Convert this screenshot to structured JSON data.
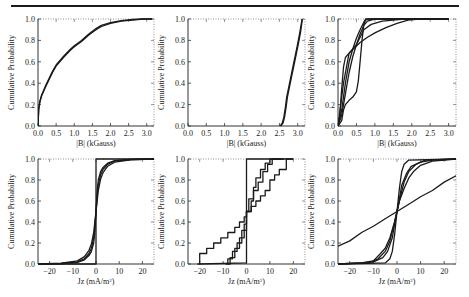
{
  "figure": {
    "top_rule": true,
    "line_color": "#1a1a1a"
  },
  "chart_data": [
    {
      "id": "panel-top-left",
      "type": "line",
      "title": "",
      "xlabel": "|B| (kGauss)",
      "ylabel": "Cumulative Probability",
      "xlim": [
        0.0,
        3.2
      ],
      "ylim": [
        0.0,
        1.0
      ],
      "xticks": [
        "0.0",
        "0.5",
        "1.0",
        "1.5",
        "2.0",
        "2.5",
        "3.0"
      ],
      "xtick_values": [
        0.0,
        0.5,
        1.0,
        1.5,
        2.0,
        2.5,
        3.0
      ],
      "yticks": [
        "0.0",
        "0.2",
        "0.4",
        "0.6",
        "0.8",
        "1.0"
      ],
      "ytick_values": [
        0.0,
        0.2,
        0.4,
        0.6,
        0.8,
        1.0
      ],
      "grid": false,
      "series": [
        {
          "name": "cdf-1",
          "x": [
            0.0,
            0.02,
            0.05,
            0.1,
            0.2,
            0.3,
            0.4,
            0.5,
            0.7,
            0.9,
            1.0,
            1.2,
            1.4,
            1.6,
            1.75,
            2.0,
            2.3,
            2.6,
            2.9,
            3.15
          ],
          "y": [
            0.0,
            0.15,
            0.22,
            0.28,
            0.36,
            0.43,
            0.5,
            0.56,
            0.64,
            0.71,
            0.74,
            0.79,
            0.85,
            0.9,
            0.93,
            0.96,
            0.98,
            0.99,
            1.0,
            1.0
          ]
        },
        {
          "name": "cdf-2",
          "x": [
            0.0,
            0.02,
            0.05,
            0.1,
            0.2,
            0.3,
            0.4,
            0.5,
            0.7,
            0.9,
            1.0,
            1.2,
            1.4,
            1.6,
            1.75,
            2.0,
            2.3,
            2.6,
            2.9,
            3.15
          ],
          "y": [
            0.0,
            0.16,
            0.23,
            0.29,
            0.37,
            0.44,
            0.51,
            0.57,
            0.65,
            0.72,
            0.75,
            0.8,
            0.86,
            0.91,
            0.94,
            0.965,
            0.985,
            0.995,
            1.0,
            1.0
          ]
        }
      ]
    },
    {
      "id": "panel-top-middle",
      "type": "line",
      "title": "",
      "xlabel": "|B| (kGauss)",
      "ylabel": "Cumulative Probability",
      "xlim": [
        0.0,
        3.2
      ],
      "ylim": [
        0.0,
        1.0
      ],
      "xticks": [
        "0.0",
        "0.5",
        "1.0",
        "1.5",
        "2.0",
        "2.5",
        "3.0"
      ],
      "xtick_values": [
        0.0,
        0.5,
        1.0,
        1.5,
        2.0,
        2.5,
        3.0
      ],
      "yticks": [
        "0.0",
        "0.2",
        "0.4",
        "0.6",
        "0.8",
        "1.0"
      ],
      "ytick_values": [
        0.0,
        0.2,
        0.4,
        0.6,
        0.8,
        1.0
      ],
      "grid": false,
      "series": [
        {
          "name": "cdf-1",
          "x": [
            2.52,
            2.58,
            2.62,
            2.66,
            2.7,
            2.76,
            2.82,
            2.88,
            2.94,
            3.0,
            3.06,
            3.12
          ],
          "y": [
            0.0,
            0.03,
            0.08,
            0.17,
            0.27,
            0.37,
            0.47,
            0.57,
            0.67,
            0.77,
            0.88,
            1.0
          ]
        },
        {
          "name": "cdf-2",
          "x": [
            2.54,
            2.6,
            2.64,
            2.68,
            2.72,
            2.78,
            2.84,
            2.9,
            2.96,
            3.02,
            3.08,
            3.13
          ],
          "y": [
            0.0,
            0.03,
            0.08,
            0.17,
            0.27,
            0.37,
            0.47,
            0.57,
            0.67,
            0.77,
            0.88,
            1.0
          ]
        }
      ]
    },
    {
      "id": "panel-top-right",
      "type": "line",
      "title": "",
      "xlabel": "|B| (kGauss)",
      "ylabel": "Cumulative Probability",
      "xlim": [
        0.0,
        3.2
      ],
      "ylim": [
        0.0,
        1.0
      ],
      "xticks": [
        "0.0",
        "0.5",
        "1.0",
        "1.5",
        "2.0",
        "2.5",
        "3.0"
      ],
      "xtick_values": [
        0.0,
        0.5,
        1.0,
        1.5,
        2.0,
        2.5,
        3.0
      ],
      "yticks": [
        "0.0",
        "0.2",
        "0.4",
        "0.6",
        "0.8",
        "1.0"
      ],
      "ytick_values": [
        0.0,
        0.2,
        0.4,
        0.6,
        0.8,
        1.0
      ],
      "grid": false,
      "series": [
        {
          "name": "cdf-a",
          "x": [
            0.0,
            0.05,
            0.1,
            0.15,
            0.2,
            0.3,
            0.45,
            0.6,
            0.8,
            1.0,
            1.3,
            1.6,
            1.9,
            2.2,
            3.0
          ],
          "y": [
            0.0,
            0.1,
            0.35,
            0.55,
            0.64,
            0.68,
            0.73,
            0.78,
            0.83,
            0.87,
            0.92,
            0.96,
            0.99,
            1.0,
            1.0
          ]
        },
        {
          "name": "cdf-b",
          "x": [
            0.0,
            0.1,
            0.15,
            0.2,
            0.3,
            0.4,
            0.5,
            0.55,
            0.6,
            0.65,
            0.7,
            0.75,
            0.8,
            1.0,
            3.0
          ],
          "y": [
            0.0,
            0.05,
            0.15,
            0.2,
            0.24,
            0.27,
            0.32,
            0.42,
            0.6,
            0.8,
            0.95,
            0.99,
            1.0,
            1.0,
            1.0
          ]
        },
        {
          "name": "cdf-c",
          "x": [
            0.0,
            0.1,
            0.2,
            0.3,
            0.4,
            0.5,
            0.6,
            0.7,
            0.75,
            0.9,
            3.0
          ],
          "y": [
            0.0,
            0.15,
            0.4,
            0.6,
            0.72,
            0.82,
            0.9,
            0.97,
            1.0,
            1.0,
            1.0
          ]
        },
        {
          "name": "cdf-d",
          "x": [
            0.0,
            0.1,
            0.2,
            0.3,
            0.4,
            0.5,
            0.6,
            0.7,
            0.8,
            1.0,
            3.0
          ],
          "y": [
            0.0,
            0.1,
            0.3,
            0.5,
            0.65,
            0.76,
            0.86,
            0.94,
            0.98,
            1.0,
            1.0
          ]
        },
        {
          "name": "cdf-e",
          "x": [
            0.0,
            0.15,
            0.3,
            0.5,
            0.7,
            0.9,
            1.2,
            1.5,
            1.8,
            2.0,
            3.0
          ],
          "y": [
            0.0,
            0.4,
            0.68,
            0.76,
            0.9,
            0.95,
            0.98,
            0.99,
            1.0,
            1.0,
            1.0
          ]
        }
      ]
    },
    {
      "id": "panel-bottom-left",
      "type": "line",
      "title": "",
      "xlabel": "Jz (mA/m",
      "xlabel_sup": "2",
      "xlabel_tail": ")",
      "ylabel": "Cumulative Probability",
      "xlim": [
        -25,
        25
      ],
      "ylim": [
        0.0,
        1.0
      ],
      "xticks": [
        "−20",
        "−10",
        "0",
        "10",
        "20"
      ],
      "xtick_values": [
        -20,
        -10,
        0,
        10,
        20
      ],
      "yticks": [
        "0.0",
        "0.2",
        "0.4",
        "0.6",
        "0.8",
        "1.0"
      ],
      "ytick_values": [
        0.0,
        0.2,
        0.4,
        0.6,
        0.8,
        1.0
      ],
      "grid": false,
      "series": [
        {
          "name": "step",
          "x": [
            -25,
            0,
            0,
            25
          ],
          "y": [
            0.0,
            0.0,
            1.0,
            1.0
          ]
        },
        {
          "name": "cdf-1",
          "x": [
            -25,
            -15,
            -8,
            -5,
            -3,
            -2,
            -1,
            -0.5,
            0,
            0.5,
            1,
            2,
            3,
            5,
            8,
            15,
            25
          ],
          "y": [
            0.0,
            0.005,
            0.02,
            0.05,
            0.1,
            0.15,
            0.25,
            0.35,
            0.5,
            0.65,
            0.75,
            0.85,
            0.9,
            0.95,
            0.98,
            0.995,
            1.0
          ]
        },
        {
          "name": "cdf-2",
          "x": [
            -25,
            -15,
            -8,
            -5,
            -3,
            -2,
            -1,
            -0.5,
            0,
            0.5,
            1,
            2,
            3,
            5,
            8,
            15,
            25
          ],
          "y": [
            0.0,
            0.008,
            0.03,
            0.07,
            0.13,
            0.19,
            0.3,
            0.4,
            0.5,
            0.6,
            0.7,
            0.81,
            0.87,
            0.93,
            0.97,
            0.992,
            1.0
          ]
        },
        {
          "name": "cdf-3",
          "x": [
            -25,
            -15,
            -8,
            -5,
            -3,
            -2,
            -1,
            -0.5,
            0,
            0.5,
            1,
            2,
            3,
            5,
            8,
            15,
            25
          ],
          "y": [
            0.0,
            0.003,
            0.015,
            0.04,
            0.08,
            0.12,
            0.2,
            0.3,
            0.5,
            0.7,
            0.8,
            0.88,
            0.92,
            0.96,
            0.985,
            0.997,
            1.0
          ]
        }
      ]
    },
    {
      "id": "panel-bottom-middle",
      "type": "line",
      "title": "",
      "xlabel": "Jz (mA/m",
      "xlabel_sup": "2",
      "xlabel_tail": ")",
      "ylabel": "Cumulative Probability",
      "xlim": [
        -25,
        25
      ],
      "ylim": [
        0.0,
        1.0
      ],
      "xticks": [
        "−20",
        "−10",
        "0",
        "10",
        "20"
      ],
      "xtick_values": [
        -20,
        -10,
        0,
        10,
        20
      ],
      "yticks": [
        "0.0",
        "0.2",
        "0.4",
        "0.6",
        "0.8",
        "1.0"
      ],
      "ytick_values": [
        0.0,
        0.2,
        0.4,
        0.6,
        0.8,
        1.0
      ],
      "grid": false,
      "series": [
        {
          "name": "step",
          "x": [
            -20,
            0,
            0,
            20
          ],
          "y": [
            0.0,
            0.01,
            1.0,
            1.0
          ]
        },
        {
          "name": "cdf-wide",
          "x": [
            -21,
            -20,
            -20,
            -17,
            -17,
            -14,
            -14,
            -11,
            -11,
            -8,
            -8,
            -5,
            -5,
            -3,
            -3,
            -1,
            -1,
            0,
            0,
            2,
            2,
            4,
            4,
            6,
            6,
            8,
            8,
            10,
            10,
            12,
            12,
            14,
            14,
            17,
            17,
            20
          ],
          "y": [
            0.0,
            0.0,
            0.1,
            0.1,
            0.15,
            0.15,
            0.2,
            0.2,
            0.25,
            0.25,
            0.3,
            0.3,
            0.35,
            0.35,
            0.4,
            0.4,
            0.45,
            0.45,
            0.5,
            0.5,
            0.55,
            0.55,
            0.6,
            0.6,
            0.65,
            0.65,
            0.7,
            0.7,
            0.8,
            0.8,
            0.85,
            0.85,
            0.9,
            0.9,
            1.0,
            1.0
          ]
        },
        {
          "name": "cdf-mid-1",
          "x": [
            -9,
            -8,
            -8,
            -6,
            -6,
            -4,
            -4,
            -2,
            -2,
            0,
            0,
            2,
            2,
            3,
            3,
            5,
            5,
            7,
            7,
            9,
            9,
            11,
            11,
            15
          ],
          "y": [
            0.0,
            0.0,
            0.05,
            0.05,
            0.12,
            0.12,
            0.2,
            0.2,
            0.32,
            0.32,
            0.5,
            0.5,
            0.6,
            0.6,
            0.7,
            0.7,
            0.78,
            0.78,
            0.88,
            0.88,
            0.95,
            0.95,
            1.0,
            1.0
          ]
        },
        {
          "name": "cdf-mid-2",
          "x": [
            -8,
            -7,
            -7,
            -5,
            -5,
            -3,
            -3,
            -1,
            -1,
            0,
            0,
            1,
            1,
            3,
            3,
            4,
            4,
            6,
            6,
            8,
            8,
            10,
            10,
            16
          ],
          "y": [
            0.0,
            0.0,
            0.06,
            0.06,
            0.15,
            0.15,
            0.25,
            0.25,
            0.38,
            0.38,
            0.5,
            0.5,
            0.62,
            0.62,
            0.73,
            0.73,
            0.82,
            0.82,
            0.9,
            0.9,
            0.96,
            0.96,
            1.0,
            1.0
          ]
        }
      ]
    },
    {
      "id": "panel-bottom-right",
      "type": "line",
      "title": "",
      "xlabel": "Jz (mA/m",
      "xlabel_sup": "2",
      "xlabel_tail": ")",
      "ylabel": "Cumulative Probability",
      "xlim": [
        -25,
        25
      ],
      "ylim": [
        0.0,
        1.0
      ],
      "xticks": [
        "−20",
        "−10",
        "0",
        "10",
        "20"
      ],
      "xtick_values": [
        -20,
        -10,
        0,
        10,
        20
      ],
      "yticks": [
        "0.0",
        "0.2",
        "0.4",
        "0.6",
        "0.8",
        "1.0"
      ],
      "ytick_values": [
        0.0,
        0.2,
        0.4,
        0.6,
        0.8,
        1.0
      ],
      "grid": false,
      "series": [
        {
          "name": "cdf-broad",
          "x": [
            -25,
            -20,
            -15,
            -10,
            -5,
            0,
            5,
            10,
            15,
            20,
            25
          ],
          "y": [
            0.17,
            0.22,
            0.3,
            0.36,
            0.43,
            0.5,
            0.57,
            0.64,
            0.7,
            0.78,
            0.84
          ]
        },
        {
          "name": "cdf-steep",
          "x": [
            -25,
            -5,
            -3,
            -2,
            -1,
            0,
            1,
            2,
            3,
            5,
            25
          ],
          "y": [
            0.0,
            0.01,
            0.05,
            0.12,
            0.28,
            0.5,
            0.72,
            0.88,
            0.95,
            0.99,
            1.0
          ]
        },
        {
          "name": "cdf-1",
          "x": [
            -25,
            -15,
            -10,
            -7,
            -5,
            -3,
            -1,
            0,
            1,
            3,
            5,
            7,
            10,
            15,
            25
          ],
          "y": [
            0.0,
            0.01,
            0.03,
            0.1,
            0.15,
            0.25,
            0.4,
            0.5,
            0.6,
            0.72,
            0.82,
            0.88,
            0.94,
            0.98,
            1.0
          ]
        },
        {
          "name": "cdf-2",
          "x": [
            -25,
            -15,
            -10,
            -6,
            -4,
            -2,
            -1,
            0,
            1,
            2,
            4,
            6,
            10,
            15,
            25
          ],
          "y": [
            0.0,
            0.01,
            0.02,
            0.06,
            0.12,
            0.25,
            0.38,
            0.5,
            0.62,
            0.75,
            0.86,
            0.93,
            0.97,
            0.99,
            1.0
          ]
        },
        {
          "name": "cdf-3",
          "x": [
            -25,
            -12,
            -8,
            -5,
            -3,
            -1,
            0,
            1,
            3,
            5,
            8,
            12,
            25
          ],
          "y": [
            0.0,
            0.01,
            0.05,
            0.12,
            0.22,
            0.4,
            0.5,
            0.6,
            0.78,
            0.88,
            0.95,
            0.99,
            1.0
          ]
        }
      ]
    }
  ],
  "layout": {
    "panels_px": [
      {
        "x0": 38,
        "x1": 154,
        "y0": 19,
        "y1": 126
      },
      {
        "x0": 188,
        "x1": 305,
        "y0": 19,
        "y1": 126
      },
      {
        "x0": 338,
        "x1": 456,
        "y0": 19,
        "y1": 126
      },
      {
        "x0": 38,
        "x1": 154,
        "y0": 159,
        "y1": 264
      },
      {
        "x0": 188,
        "x1": 305,
        "y0": 159,
        "y1": 264
      },
      {
        "x0": 338,
        "x1": 456,
        "y0": 159,
        "y1": 264
      }
    ]
  }
}
